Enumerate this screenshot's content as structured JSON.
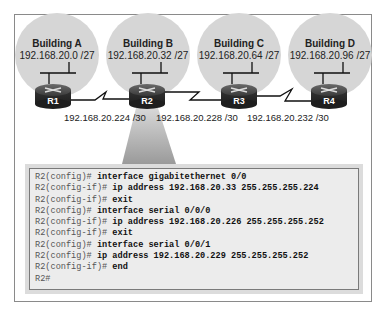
{
  "buildings": [
    {
      "name": "Building A",
      "subnet": "192.168.20.0 /27",
      "router": "R1"
    },
    {
      "name": "Building B",
      "subnet": "192.168.20.32 /27",
      "router": "R2"
    },
    {
      "name": "Building C",
      "subnet": "192.168.20.64 /27",
      "router": "R3"
    },
    {
      "name": "Building D",
      "subnet": "192.168.20.96 /27",
      "router": "R4"
    }
  ],
  "links": [
    {
      "from": "R1",
      "to": "R2",
      "subnet": "192.168.20.224 /30"
    },
    {
      "from": "R2",
      "to": "R3",
      "subnet": "192.168.20.228 /30"
    },
    {
      "from": "R3",
      "to": "R4",
      "subnet": "192.168.20.232 /30"
    }
  ],
  "terminal": {
    "lines": [
      {
        "prompt": "R2(config)# ",
        "cmd": "interface gigabitethernet 0/0"
      },
      {
        "prompt": "R2(config-if)# ",
        "cmd": "ip address 192.168.20.33 255.255.255.224"
      },
      {
        "prompt": "R2(config-if)# ",
        "cmd": "exit"
      },
      {
        "prompt": "R2(config)# ",
        "cmd": "interface serial 0/0/0"
      },
      {
        "prompt": "R2(config-if)# ",
        "cmd": "ip address 192.168.20.226 255.255.255.252"
      },
      {
        "prompt": "R2(config-if)# ",
        "cmd": "exit"
      },
      {
        "prompt": "R2(config)# ",
        "cmd": "interface serial 0/0/1"
      },
      {
        "prompt": "R2(config)# ",
        "cmd": "ip address 192.168.20.229 255.255.255.252"
      },
      {
        "prompt": "R2(config-if)# ",
        "cmd": "end"
      },
      {
        "prompt": "R2#",
        "cmd": ""
      }
    ]
  },
  "colors": {
    "lan_circle": "#d6d6d6",
    "router_body": "#3c3c3c",
    "terminal_bg": "#ececec"
  }
}
